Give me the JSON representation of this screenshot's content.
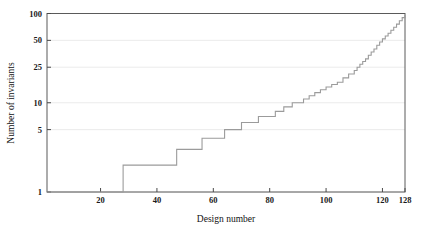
{
  "chart_data": {
    "type": "line",
    "title": "",
    "xlabel": "Design number",
    "ylabel": "Number of invariants",
    "xlim": [
      1,
      128
    ],
    "ylim": [
      1,
      100
    ],
    "yscale": "log",
    "xscale": "linear",
    "grid": true,
    "legend": null,
    "xticks": [
      20,
      40,
      60,
      80,
      100,
      120,
      128
    ],
    "xtick_labels": [
      "20",
      "40",
      "60",
      "80",
      "100",
      "120",
      "128"
    ],
    "yticks": [
      1,
      5,
      10,
      25,
      50,
      100
    ],
    "ytick_labels": [
      "1",
      "5",
      "10",
      "25",
      "50",
      "100"
    ],
    "series": [
      {
        "name": "invariants",
        "style": "step-post",
        "color": "#9b9b9b",
        "x": [
          1,
          27,
          28,
          43,
          47,
          52,
          56,
          60,
          64,
          67,
          70,
          73,
          76,
          79,
          82,
          85,
          88,
          90,
          92,
          94,
          96,
          98,
          100,
          102,
          104,
          106,
          108,
          110,
          111,
          112,
          113,
          114,
          115,
          116,
          117,
          118,
          119,
          120,
          121,
          122,
          123,
          124,
          125,
          126,
          127,
          128
        ],
        "y": [
          1,
          1,
          2,
          2,
          3,
          3,
          4,
          4,
          5,
          5,
          6,
          6,
          7,
          7,
          8,
          9,
          10,
          10,
          11,
          12,
          13,
          14,
          15,
          16,
          17,
          19,
          21,
          23,
          25,
          27,
          29,
          31,
          34,
          37,
          40,
          44,
          48,
          52,
          56,
          60,
          65,
          70,
          76,
          83,
          90,
          96
        ]
      }
    ]
  },
  "axes": {
    "x_title": "Design number",
    "y_title": "Number of invariants"
  }
}
